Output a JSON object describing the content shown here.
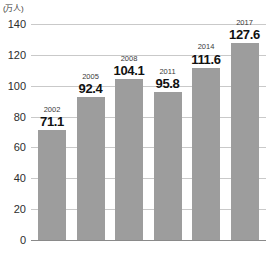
{
  "chart_data": {
    "type": "bar",
    "title": "",
    "subtitle": "",
    "xlabel": "",
    "ylabel": "",
    "unit_label": "(万人)",
    "categories": [
      "2002",
      "2005",
      "2008",
      "2011",
      "2014",
      "2017"
    ],
    "values": [
      71.1,
      92.4,
      104.1,
      95.8,
      111.6,
      127.6
    ],
    "value_labels": [
      "71.1",
      "92.4",
      "104.1",
      "95.8",
      "111.6",
      "127.6"
    ],
    "ylim": [
      0,
      140
    ],
    "yticks": [
      0,
      20,
      40,
      60,
      80,
      100,
      120,
      140
    ],
    "ytick_labels": [
      "0",
      "20",
      "40",
      "60",
      "80",
      "100",
      "120",
      "140"
    ],
    "grid": true,
    "legend": false,
    "legend_position": "none",
    "bar_color": "#9d9d9d",
    "grid_color": "#c9c9c9",
    "axis_color": "#8a8a8a",
    "background_color": "#ffffff"
  }
}
